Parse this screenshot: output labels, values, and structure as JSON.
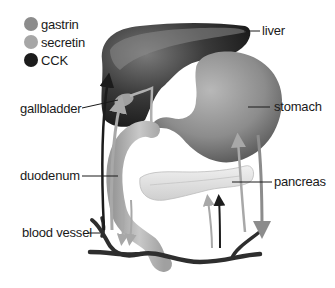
{
  "legend": {
    "items": [
      {
        "label": "gastrin",
        "color": "#8c8c8c"
      },
      {
        "label": "secretin",
        "color": "#a6a6a6"
      },
      {
        "label": "CCK",
        "color": "#1c1c1c"
      }
    ]
  },
  "labels": {
    "liver": "liver",
    "gallbladder": "gallbladder",
    "stomach": "stomach",
    "duodenum": "duodenum",
    "pancreas": "pancreas",
    "blood_vessel": "blood vessel"
  },
  "colors": {
    "liver": "#2a2a2a",
    "liver_light": "#6e6e6e",
    "stomach": "#8a8a8a",
    "duodenum": "#b4b4b4",
    "pancreas": "#e2e2e2",
    "vessel": "#2e2e2e"
  }
}
